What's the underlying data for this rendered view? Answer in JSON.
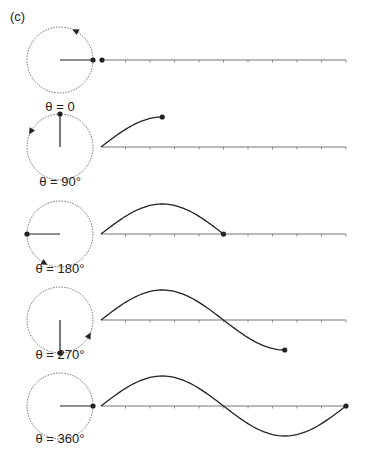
{
  "figure_label": "(c)",
  "colors": {
    "ink": "#222222",
    "axis": "#777777",
    "circle": "#666666"
  },
  "layout": {
    "circle_cx": 60,
    "circle_r": 33,
    "wave_x0": 101,
    "wave_length": 245,
    "amplitude": 30,
    "tick_count": 10
  },
  "panels": [
    {
      "label": "θ = 0",
      "angle_deg": 0,
      "axis_y": 60,
      "label_y": 111
    },
    {
      "label": "θ = 90°",
      "angle_deg": 90,
      "axis_y": 147,
      "label_y": 186
    },
    {
      "label": "θ = 180°",
      "angle_deg": 180,
      "axis_y": 234,
      "label_y": 273
    },
    {
      "label": "θ = 270°",
      "angle_deg": 270,
      "axis_y": 320,
      "label_y": 359
    },
    {
      "label": "θ = 360°",
      "angle_deg": 360,
      "axis_y": 406,
      "label_y": 443
    }
  ]
}
